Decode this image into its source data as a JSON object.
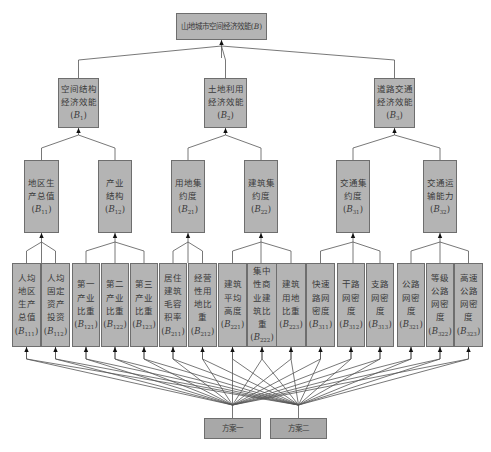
{
  "goal": {
    "id": "root",
    "text": "山地城市空间经济效能",
    "code": "B",
    "sub": ""
  },
  "criteria": [
    {
      "id": "B1",
      "text": "空间结构\n经济效能",
      "code": "B",
      "sub": "1"
    },
    {
      "id": "B2",
      "text": "土地利用\n经济效能",
      "code": "B",
      "sub": "2"
    },
    {
      "id": "B3",
      "text": "道路交通\n经济效能",
      "code": "B",
      "sub": "3"
    }
  ],
  "subcriteria": [
    {
      "id": "B11",
      "parent": "B1",
      "text": "地区生\n产总值",
      "code": "B",
      "sub": "11"
    },
    {
      "id": "B12",
      "parent": "B1",
      "text": "产业\n结构",
      "code": "B",
      "sub": "12"
    },
    {
      "id": "B21",
      "parent": "B2",
      "text": "用地集\n约度",
      "code": "B",
      "sub": "21"
    },
    {
      "id": "B22",
      "parent": "B2",
      "text": "建筑集\n约度",
      "code": "B",
      "sub": "22"
    },
    {
      "id": "B31",
      "parent": "B3",
      "text": "交通集\n约度",
      "code": "B",
      "sub": "31"
    },
    {
      "id": "B32",
      "parent": "B3",
      "text": "交通运\n输能力",
      "code": "B",
      "sub": "32"
    }
  ],
  "indicators": [
    {
      "id": "B111",
      "parent": "B11",
      "text": "人均\n地区\n生产\n总值",
      "code": "B",
      "sub": "111"
    },
    {
      "id": "B112",
      "parent": "B11",
      "text": "人均\n固定\n资产\n投资",
      "code": "B",
      "sub": "112"
    },
    {
      "id": "B121",
      "parent": "B12",
      "text": "第一\n产业\n比重",
      "code": "B",
      "sub": "121"
    },
    {
      "id": "B122",
      "parent": "B12",
      "text": "第二\n产业\n比重",
      "code": "B",
      "sub": "122"
    },
    {
      "id": "B123",
      "parent": "B12",
      "text": "第三\n产业\n比重",
      "code": "B",
      "sub": "123"
    },
    {
      "id": "B211",
      "parent": "B21",
      "text": "居住\n建筑\n毛容\n积率",
      "code": "B",
      "sub": "211"
    },
    {
      "id": "B212",
      "parent": "B21",
      "text": "经营\n性用\n地比重",
      "code": "B",
      "sub": "212"
    },
    {
      "id": "B221",
      "parent": "B22",
      "text": "建筑\n平均\n高度",
      "code": "B",
      "sub": "221"
    },
    {
      "id": "B222",
      "parent": "B22",
      "text": "集中\n性商\n业建\n筑比重",
      "code": "B",
      "sub": "222"
    },
    {
      "id": "B223",
      "parent": "B22",
      "text": "建筑\n用地\n比重",
      "code": "B",
      "sub": "223"
    },
    {
      "id": "B311",
      "parent": "B31",
      "text": "快速\n路网\n密度",
      "code": "B",
      "sub": "311"
    },
    {
      "id": "B312",
      "parent": "B31",
      "text": "干路\n网密度",
      "code": "B",
      "sub": "312"
    },
    {
      "id": "B313",
      "parent": "B31",
      "text": "支路\n网密度",
      "code": "B",
      "sub": "313"
    },
    {
      "id": "B321",
      "parent": "B32",
      "text": "公路\n网密度",
      "code": "B",
      "sub": "321"
    },
    {
      "id": "B322",
      "parent": "B32",
      "text": "等级\n公路\n网密度",
      "code": "B",
      "sub": "322"
    },
    {
      "id": "B323",
      "parent": "B32",
      "text": "高速\n公路\n网密度",
      "code": "B",
      "sub": "323"
    }
  ],
  "alternatives": [
    {
      "id": "alt1",
      "text": "方案一"
    },
    {
      "id": "alt2",
      "text": "方案二"
    }
  ],
  "colors": {
    "box_fill": "#b4b4b4",
    "box_border": "#6e6e6e",
    "line": "#555555",
    "text": "#3a3a3a"
  }
}
